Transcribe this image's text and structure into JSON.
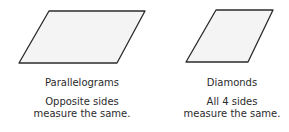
{
  "figures": [
    {
      "name": "Parallelograms",
      "description_line1": "Opposite sides",
      "description_line2": "measure the same.",
      "points": "49,11 145,11 117,63 19,63"
    },
    {
      "name": "Diamonds",
      "description_line1": "All 4 sides",
      "description_line2": "measure the same.",
      "points": "216,10 273,10 248,62 186,62"
    }
  ],
  "colors": {
    "fill": "#f4f4f4",
    "stroke": "#2b2b2b",
    "text": "#2b2b2b"
  }
}
